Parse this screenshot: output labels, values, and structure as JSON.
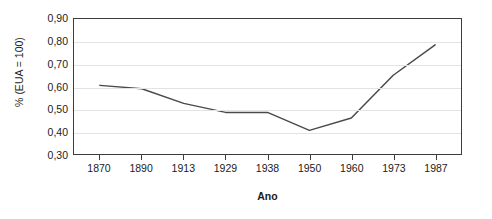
{
  "chart_data": {
    "type": "line",
    "title": "",
    "subtitle": "",
    "xlabel": "Ano",
    "ylabel": "% (EUA = 100)",
    "categories": [
      "1870",
      "1890",
      "1913",
      "1929",
      "1938",
      "1950",
      "1960",
      "1973",
      "1987"
    ],
    "values": [
      0.605,
      0.59,
      0.525,
      0.485,
      0.485,
      0.405,
      0.46,
      0.65,
      0.785
    ],
    "series": [
      {
        "name": "",
        "values": [
          0.605,
          0.59,
          0.525,
          0.485,
          0.485,
          0.405,
          0.46,
          0.65,
          0.785
        ]
      }
    ],
    "ylim": [
      0.3,
      0.9
    ],
    "ytick_labels": [
      "0,90",
      "0,80",
      "0,70",
      "0,60",
      "0,50",
      "0,40",
      "0,30"
    ],
    "ytick_values": [
      0.9,
      0.8,
      0.7,
      0.6,
      0.5,
      0.4,
      0.3
    ],
    "grid": "horizontal",
    "legend": "none",
    "line_color": "#4a4a4a",
    "grid_color": "#e3e3e3",
    "frame_color": "#3c3c3c",
    "background": "#ffffff"
  }
}
